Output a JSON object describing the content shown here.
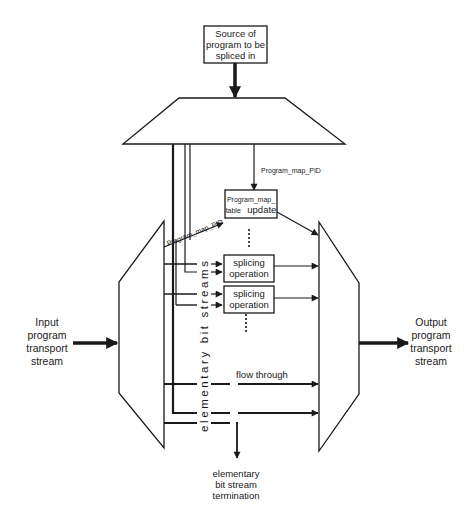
{
  "diagram": {
    "source_box": {
      "lines": [
        "Source of",
        "program to be",
        "spliced in"
      ]
    },
    "top_mux": {
      "shape": "trapezoid"
    },
    "left_demux": {
      "shape": "trapezoid"
    },
    "right_mux": {
      "shape": "trapezoid"
    },
    "pid_label_top": "Program_map_PID",
    "pid_label_diag": "Program_map_PID",
    "pmt_update_box": {
      "line1": "Program_map_",
      "line2_small": "table",
      "line2_big": "update"
    },
    "splicing_boxes": [
      {
        "line1": "splicing",
        "line2": "operation"
      },
      {
        "line1": "splicing",
        "line2": "operation"
      }
    ],
    "ellipsis_glyph": "•••••",
    "vertical_label": "elementary bit streams",
    "flow_through_label": "flow through",
    "input_label": [
      "Input",
      "program",
      "transport",
      "stream"
    ],
    "output_label": [
      "Output",
      "program",
      "transport",
      "stream"
    ],
    "termination_label": [
      "elementary",
      "bit stream",
      "termination"
    ],
    "colors": {
      "stroke": "#1a1a1a",
      "background": "#ffffff"
    }
  }
}
